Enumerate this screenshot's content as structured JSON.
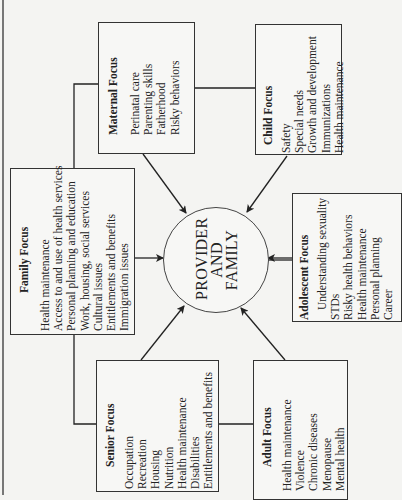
{
  "center": {
    "lines": [
      "PROVIDER",
      "AND",
      "FAMILY"
    ]
  },
  "boxes": {
    "maternal": {
      "title": "Maternal Focus",
      "items": [
        "Perinatal care",
        "Parenting skills",
        "Fatherhood",
        "Risky behaviors"
      ]
    },
    "child": {
      "title": "Child Focus",
      "items": [
        "Safety",
        "Special needs",
        "Growth and development",
        "Immunizations",
        "Health maintenance"
      ]
    },
    "family": {
      "title": "Family Focus",
      "items": [
        "Health maintenance",
        "Access to and use of health services",
        "Personal planning and education",
        "Work, housing, social services",
        "Cultural issues",
        "Entitlements and benefits",
        "Immigration issues"
      ]
    },
    "adolescent": {
      "title": "Adolescent Focus",
      "items": [
        "Understanding sexuality",
        "STDs",
        "Risky health behaviors",
        "Health maintenance",
        "Personal planning",
        "Career"
      ]
    },
    "senior": {
      "title": "Senior Focus",
      "items": [
        "Occupation",
        "Recreation",
        "Housing",
        "Nutrition",
        "Health maintenance",
        "Disabilities",
        "Entitlements and benefits"
      ]
    },
    "adult": {
      "title": "Adult Focus",
      "items": [
        "Health maintenance",
        "Violence",
        "Chronic diseases",
        "Menopause",
        "Mental health"
      ]
    }
  }
}
